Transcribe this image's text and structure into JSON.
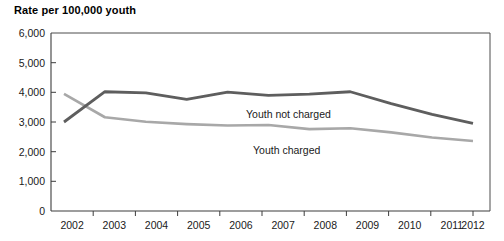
{
  "chart_data": {
    "type": "line",
    "title": "Rate per 100,000 youth",
    "xlabel": "",
    "ylabel": "",
    "ylim": [
      0,
      6000
    ],
    "ytick_labels": [
      "0",
      "1,000",
      "2,000",
      "3,000",
      "4,000",
      "5,000",
      "6,000"
    ],
    "ytick_values": [
      0,
      1000,
      2000,
      3000,
      4000,
      5000,
      6000
    ],
    "grid": false,
    "legend_position": "inline-annotation",
    "categories": [
      "2002",
      "2003",
      "2004",
      "2005",
      "2006",
      "2007",
      "2008",
      "2009",
      "2010",
      "2011",
      "2012"
    ],
    "x": [
      2002,
      2003,
      2004,
      2005,
      2006,
      2007,
      2008,
      2009,
      2010,
      2011,
      2012
    ],
    "series": [
      {
        "name": "Youth not charged",
        "color": "#5e5e5e",
        "values": [
          3000,
          4020,
          3980,
          3760,
          4010,
          3900,
          3940,
          4020,
          3620,
          3260,
          2950
        ]
      },
      {
        "name": "Youth charged",
        "color": "#a8a8a8",
        "values": [
          3950,
          3160,
          3010,
          2930,
          2880,
          2900,
          2760,
          2790,
          2650,
          2480,
          2360
        ]
      }
    ],
    "annotations": [
      {
        "text": "Youth not charged",
        "series": "Youth not charged",
        "x_px": 246,
        "y_px": 114
      },
      {
        "text": "Youth charged",
        "series": "Youth charged",
        "x_px": 253,
        "y_px": 150
      }
    ]
  },
  "axes": {
    "plot_left_px": 51,
    "plot_right_px": 490,
    "plot_top_px": 33,
    "plot_bottom_px": 211
  },
  "colors": {
    "series_not_charged": "#5e5e5e",
    "series_charged": "#a8a8a8",
    "axis": "#3d3d3d",
    "text": "#1a1a1a",
    "background": "#ffffff"
  }
}
